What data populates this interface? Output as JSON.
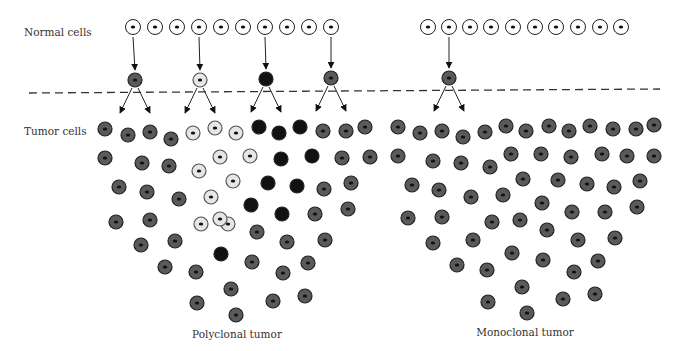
{
  "labels": {
    "normal_cells": "Normal cells",
    "tumor_cells": "Tumor cells",
    "polyclonal_tumor": "Polyclonal tumor",
    "monoclonal_tumor": "Monoclonal tumor"
  },
  "colors": {
    "normal": "#ffffff",
    "gray_clone": "#5a5a5a",
    "light_clone": "#e6e6e6",
    "dark_clone": "#111111",
    "outline": "#333333",
    "nucleus": "#111111"
  },
  "normal_cells": {
    "left_count": 10,
    "right_count": 10,
    "left_transformed_indices": [
      0,
      3,
      6,
      9
    ],
    "right_transformed_indices": [
      1
    ]
  },
  "transformed_cells": [
    {
      "clone": "gray",
      "side": "left"
    },
    {
      "clone": "light",
      "side": "left"
    },
    {
      "clone": "dark",
      "side": "left"
    },
    {
      "clone": "gray",
      "side": "left"
    },
    {
      "clone": "gray",
      "side": "right"
    }
  ],
  "polyclonal_tumor": {
    "gray_cells": 33,
    "light_cells": 11,
    "dark_cells": 10
  },
  "monoclonal_tumor": {
    "gray_cells": 53
  }
}
